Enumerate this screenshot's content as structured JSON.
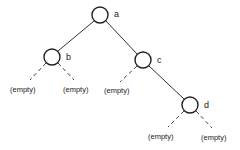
{
  "diagram": {
    "type": "binary-tree",
    "nodes": [
      {
        "id": "a",
        "label": "a",
        "cx": 100,
        "cy": 15,
        "r": 8,
        "lx": 114,
        "ly": 17
      },
      {
        "id": "b",
        "label": "b",
        "cx": 52,
        "cy": 57,
        "r": 8,
        "lx": 66,
        "ly": 60
      },
      {
        "id": "c",
        "label": "c",
        "cx": 143,
        "cy": 60,
        "r": 8,
        "lx": 157,
        "ly": 63
      },
      {
        "id": "d",
        "label": "d",
        "cx": 190,
        "cy": 105,
        "r": 8,
        "lx": 204,
        "ly": 108
      }
    ],
    "edges": [
      {
        "from": "a",
        "to": "b",
        "x1": 94,
        "y1": 21,
        "x2": 58,
        "y2": 51
      },
      {
        "from": "a",
        "to": "c",
        "x1": 106,
        "y1": 21,
        "x2": 137,
        "y2": 54
      },
      {
        "from": "c",
        "to": "d",
        "x1": 149,
        "y1": 66,
        "x2": 184,
        "y2": 99
      }
    ],
    "empty_edges": [
      {
        "parent": "b",
        "x1": 46,
        "y1": 63,
        "x2": 30,
        "y2": 80
      },
      {
        "parent": "b",
        "x1": 58,
        "y1": 63,
        "x2": 74,
        "y2": 80
      },
      {
        "parent": "c",
        "x1": 137,
        "y1": 66,
        "x2": 120,
        "y2": 82
      },
      {
        "parent": "d",
        "x1": 184,
        "y1": 111,
        "x2": 168,
        "y2": 127
      },
      {
        "parent": "d",
        "x1": 196,
        "y1": 111,
        "x2": 212,
        "y2": 128
      }
    ],
    "empty_labels": [
      {
        "text": "(empty)",
        "x": 10,
        "y": 92
      },
      {
        "text": "(empty)",
        "x": 63,
        "y": 92
      },
      {
        "text": "(empty)",
        "x": 104,
        "y": 93
      },
      {
        "text": "(empty)",
        "x": 148,
        "y": 139
      },
      {
        "text": "(empty)",
        "x": 201,
        "y": 140
      }
    ]
  }
}
